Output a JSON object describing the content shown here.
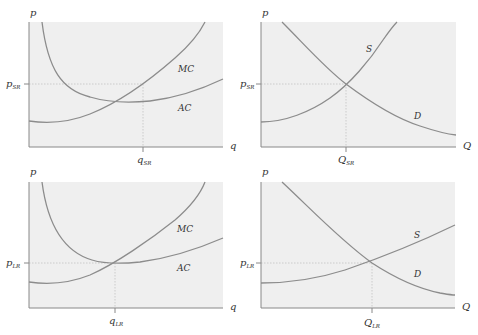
{
  "panels": [
    {
      "id": "firm-short-run",
      "y_axis": "p",
      "x_axis": "q",
      "price_label": "p",
      "price_sub": "SR",
      "qty_label": "q",
      "qty_sub": "SR",
      "curve_labels": [
        "MC",
        "AC"
      ]
    },
    {
      "id": "market-short-run",
      "y_axis": "p",
      "x_axis": "Q",
      "price_label": "p",
      "price_sub": "SR",
      "qty_label": "Q",
      "qty_sub": "SR",
      "curve_labels": [
        "S",
        "D"
      ]
    },
    {
      "id": "firm-long-run",
      "y_axis": "p",
      "x_axis": "q",
      "price_label": "p",
      "price_sub": "LR",
      "qty_label": "q",
      "qty_sub": "LR",
      "curve_labels": [
        "MC",
        "AC"
      ]
    },
    {
      "id": "market-long-run",
      "y_axis": "p",
      "x_axis": "Q",
      "price_label": "p",
      "price_sub": "LR",
      "qty_label": "Q",
      "qty_sub": "LR",
      "curve_labels": [
        "S",
        "D"
      ]
    }
  ],
  "colors": {
    "curve": "#8c8c8c",
    "plot_background": "#efefef",
    "axis": "#888888"
  }
}
